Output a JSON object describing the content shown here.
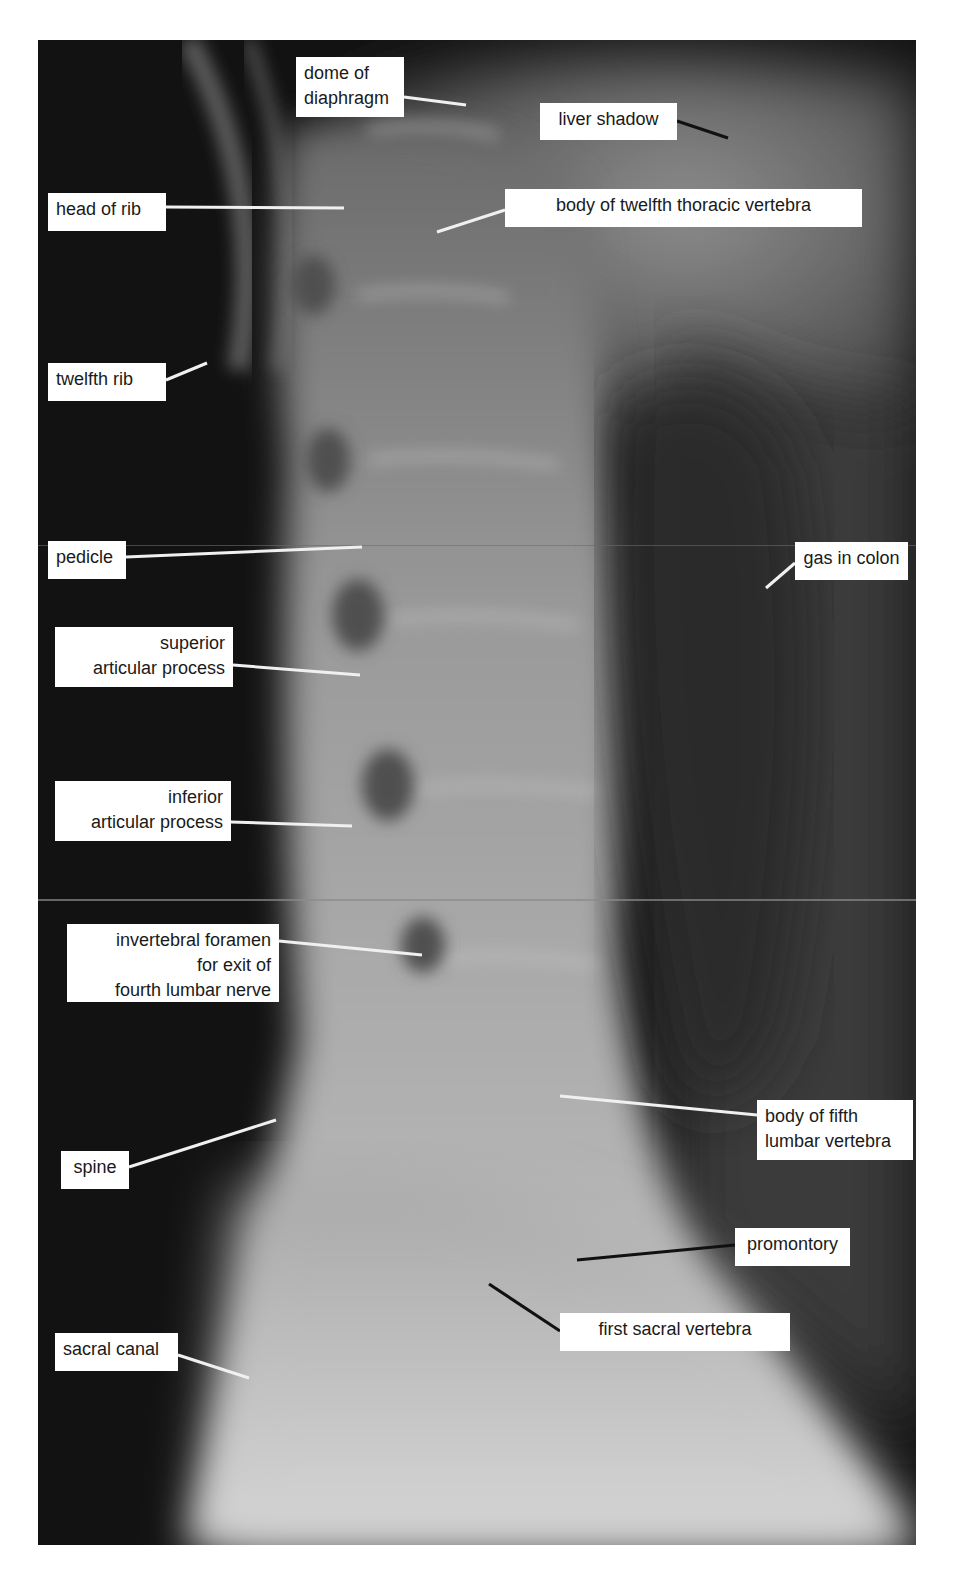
{
  "figure": {
    "colors": {
      "background": "#ffffff",
      "film_dark": "#101010",
      "bone_light": "#c8c8c8",
      "label_bg": "#ffffff",
      "label_text": "#1a1a1a",
      "leader_white": "#f0f0f0",
      "leader_black": "#111111"
    }
  },
  "labels": [
    {
      "id": "dome-of-diaphragm",
      "text": "dome of\ndiaphragm",
      "box": [
        296,
        57,
        108,
        60
      ],
      "align": "left",
      "leader": {
        "x1": 404,
        "y1": 97,
        "x2": 466,
        "y2": 105,
        "color": "white"
      }
    },
    {
      "id": "liver-shadow",
      "text": "liver shadow",
      "box": [
        540,
        103,
        137,
        37
      ],
      "align": "center",
      "leader": {
        "x1": 677,
        "y1": 121,
        "x2": 728,
        "y2": 138,
        "color": "black"
      }
    },
    {
      "id": "head-of-rib",
      "text": "head of rib",
      "box": [
        48,
        193,
        118,
        38
      ],
      "align": "left",
      "leader": {
        "x1": 166,
        "y1": 207,
        "x2": 344,
        "y2": 208,
        "color": "white"
      }
    },
    {
      "id": "body-of-twelfth-thoracic-vertebra",
      "text": "body of twelfth thoracic vertebra",
      "box": [
        505,
        189,
        357,
        38
      ],
      "align": "center",
      "leader": {
        "x1": 505,
        "y1": 210,
        "x2": 437,
        "y2": 232,
        "color": "white"
      }
    },
    {
      "id": "twelfth-rib",
      "text": "twelfth rib",
      "box": [
        48,
        363,
        118,
        38
      ],
      "align": "left",
      "leader": {
        "x1": 166,
        "y1": 380,
        "x2": 207,
        "y2": 363,
        "color": "white"
      }
    },
    {
      "id": "pedicle",
      "text": "pedicle",
      "box": [
        48,
        541,
        78,
        38
      ],
      "align": "left",
      "leader": {
        "x1": 126,
        "y1": 557,
        "x2": 362,
        "y2": 547,
        "color": "white"
      }
    },
    {
      "id": "gas-in-colon",
      "text": "gas in colon",
      "box": [
        795,
        542,
        113,
        38
      ],
      "align": "center",
      "leader": {
        "x1": 795,
        "y1": 563,
        "x2": 766,
        "y2": 588,
        "color": "white"
      }
    },
    {
      "id": "superior-articular-process",
      "text": "superior\narticular process",
      "box": [
        55,
        627,
        178,
        60
      ],
      "align": "right",
      "leader": {
        "x1": 233,
        "y1": 665,
        "x2": 360,
        "y2": 675,
        "color": "white"
      }
    },
    {
      "id": "inferior-articular-process",
      "text": "inferior\narticular process",
      "box": [
        55,
        781,
        176,
        60
      ],
      "align": "right",
      "leader": {
        "x1": 231,
        "y1": 822,
        "x2": 352,
        "y2": 826,
        "color": "white"
      }
    },
    {
      "id": "intervertebral-foramen",
      "text": "invertebral foramen\nfor exit of\nfourth lumbar nerve",
      "box": [
        67,
        924,
        212,
        78
      ],
      "align": "right",
      "leader": {
        "x1": 279,
        "y1": 941,
        "x2": 422,
        "y2": 955,
        "color": "white"
      }
    },
    {
      "id": "body-of-fifth-lumbar-vertebra",
      "text": "body of fifth\nlumbar vertebra",
      "box": [
        757,
        1100,
        156,
        60
      ],
      "align": "left",
      "leader": {
        "x1": 757,
        "y1": 1115,
        "x2": 560,
        "y2": 1096,
        "color": "white"
      }
    },
    {
      "id": "spine",
      "text": "spine",
      "box": [
        61,
        1151,
        68,
        38
      ],
      "align": "center",
      "leader": {
        "x1": 129,
        "y1": 1167,
        "x2": 276,
        "y2": 1120,
        "color": "white"
      }
    },
    {
      "id": "promontory",
      "text": "promontory",
      "box": [
        735,
        1228,
        115,
        38
      ],
      "align": "center",
      "leader": {
        "x1": 735,
        "y1": 1245,
        "x2": 577,
        "y2": 1260,
        "color": "black"
      }
    },
    {
      "id": "first-sacral-vertebra",
      "text": "first sacral vertebra",
      "box": [
        560,
        1313,
        230,
        38
      ],
      "align": "center",
      "leader": {
        "x1": 560,
        "y1": 1331,
        "x2": 489,
        "y2": 1284,
        "color": "black"
      }
    },
    {
      "id": "sacral-canal",
      "text": "sacral canal",
      "box": [
        55,
        1333,
        123,
        38
      ],
      "align": "left",
      "leader": {
        "x1": 178,
        "y1": 1355,
        "x2": 249,
        "y2": 1378,
        "color": "white"
      }
    }
  ]
}
